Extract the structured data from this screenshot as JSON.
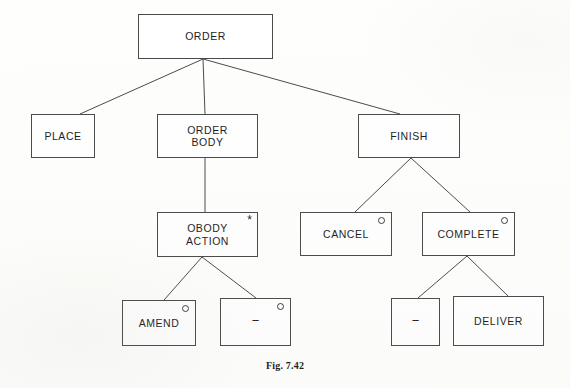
{
  "figure": {
    "caption": "Fig. 7.42",
    "background_color": "#fefefc",
    "line_color": "#4a4a4a",
    "text_color": "#1d1d1d"
  },
  "legend": {
    "iteration_marker": "*",
    "selection_marker": "○",
    "null_label": "−"
  },
  "nodes": [
    {
      "id": "order",
      "label": "ORDER",
      "marker": "",
      "x": 138,
      "y": 14,
      "w": 135,
      "h": 45
    },
    {
      "id": "place",
      "label": "PLACE",
      "marker": "",
      "x": 31,
      "y": 114,
      "w": 64,
      "h": 44
    },
    {
      "id": "order-body",
      "label": "ORDER\nBODY",
      "marker": "",
      "x": 157,
      "y": 114,
      "w": 101,
      "h": 44
    },
    {
      "id": "finish",
      "label": "FINISH",
      "marker": "",
      "x": 358,
      "y": 114,
      "w": 102,
      "h": 44
    },
    {
      "id": "obody-action",
      "label": "OBODY\nACTION",
      "marker": "iteration",
      "x": 157,
      "y": 212,
      "w": 101,
      "h": 45
    },
    {
      "id": "cancel",
      "label": "CANCEL",
      "marker": "selection",
      "x": 300,
      "y": 212,
      "w": 92,
      "h": 44
    },
    {
      "id": "complete",
      "label": "COMPLETE",
      "marker": "selection",
      "x": 422,
      "y": 212,
      "w": 93,
      "h": 44
    },
    {
      "id": "amend",
      "label": "AMEND",
      "marker": "selection",
      "x": 122,
      "y": 300,
      "w": 74,
      "h": 46
    },
    {
      "id": "obody-null",
      "label": "−",
      "marker": "selection",
      "x": 220,
      "y": 298,
      "w": 71,
      "h": 48
    },
    {
      "id": "complete-null",
      "label": "−",
      "marker": "",
      "x": 391,
      "y": 298,
      "w": 49,
      "h": 48
    },
    {
      "id": "deliver",
      "label": "DELIVER",
      "marker": "",
      "x": 453,
      "y": 296,
      "w": 91,
      "h": 50
    }
  ],
  "edges": [
    {
      "id": "order-place",
      "from": "order",
      "to": "place",
      "x1": 203,
      "y1": 59,
      "x2": 80,
      "y2": 114
    },
    {
      "id": "order-order-body",
      "from": "order",
      "to": "order-body",
      "x1": 203,
      "y1": 59,
      "x2": 205,
      "y2": 114
    },
    {
      "id": "order-finish",
      "from": "order",
      "to": "finish",
      "x1": 203,
      "y1": 59,
      "x2": 400,
      "y2": 114
    },
    {
      "id": "order-body-obody-action",
      "from": "order-body",
      "to": "obody-action",
      "x1": 205,
      "y1": 158,
      "x2": 205,
      "y2": 212
    },
    {
      "id": "finish-cancel",
      "from": "finish",
      "to": "cancel",
      "x1": 411,
      "y1": 158,
      "x2": 355,
      "y2": 212
    },
    {
      "id": "finish-complete",
      "from": "finish",
      "to": "complete",
      "x1": 411,
      "y1": 158,
      "x2": 470,
      "y2": 212
    },
    {
      "id": "obody-action-amend",
      "from": "obody-action",
      "to": "amend",
      "x1": 202,
      "y1": 257,
      "x2": 164,
      "y2": 300
    },
    {
      "id": "obody-action-null",
      "from": "obody-action",
      "to": "obody-null",
      "x1": 202,
      "y1": 257,
      "x2": 256,
      "y2": 298
    },
    {
      "id": "complete-null-edge",
      "from": "complete",
      "to": "complete-null",
      "x1": 467,
      "y1": 256,
      "x2": 418,
      "y2": 298
    },
    {
      "id": "complete-deliver",
      "from": "complete",
      "to": "deliver",
      "x1": 467,
      "y1": 256,
      "x2": 508,
      "y2": 296
    }
  ]
}
